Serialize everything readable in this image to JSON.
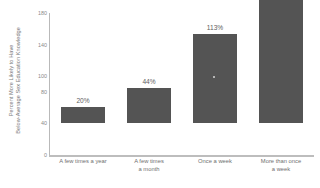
{
  "chart_data": {
    "type": "bar",
    "title": "",
    "subtitle": "",
    "xlabel": "",
    "ylabel_lines": [
      "Percent More Likely to Have",
      "Below-Average Sex Education Knowledge"
    ],
    "categories": [
      "A few times a year",
      "A few times a month",
      "Once a week",
      "More than once a week"
    ],
    "category_lines": [
      [
        "A few times a year"
      ],
      [
        "A few times",
        "a month"
      ],
      [
        "Once a week"
      ],
      [
        "More than once",
        "a week"
      ]
    ],
    "values": [
      20,
      44,
      113,
      170
    ],
    "value_labels": [
      "20%",
      "44%",
      "113%",
      "170%"
    ],
    "ylim": [
      0,
      180
    ],
    "yticks": [
      0,
      20,
      40,
      60,
      80,
      100,
      120,
      140,
      160,
      180
    ],
    "ytick_labels": [
      "0",
      "20",
      "40",
      "60",
      "80",
      "100",
      "120",
      "140",
      "160",
      "180"
    ],
    "ytick_labels_visible": [
      "0",
      "40",
      "80",
      "100",
      "140",
      "180"
    ],
    "grid": false,
    "legend": false,
    "bar_color": "#545454",
    "axis_color": "#bdbdbd",
    "text_color": "#6f6f6f",
    "background": "#ffffff"
  }
}
